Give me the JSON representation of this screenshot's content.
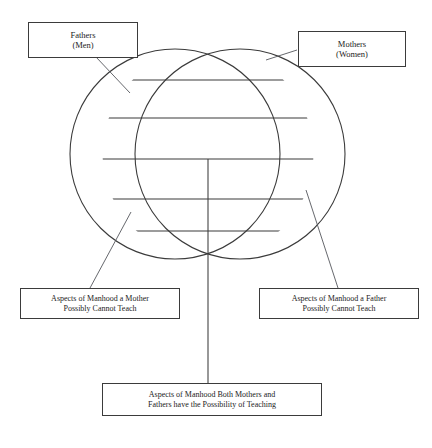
{
  "diagram": {
    "type": "venn-overlapping-circles",
    "background_color": "#ffffff",
    "stroke_color": "#3b3b3b",
    "boxes": [
      {
        "id": "fathers",
        "name": "fathers-men-box",
        "lines": [
          "Fathers",
          "(Men)"
        ],
        "position": "top-left"
      },
      {
        "id": "mothers",
        "name": "mothers-women-box",
        "lines": [
          "Mothers",
          "(Women)"
        ],
        "position": "top-right"
      },
      {
        "id": "mother_cannot",
        "name": "aspects-mother-cannot-teach-box",
        "lines": [
          "Aspects of Manhood a Mother",
          "Possibly Cannot Teach"
        ],
        "position": "bottom-left"
      },
      {
        "id": "father_cannot",
        "name": "aspects-father-cannot-teach-box",
        "lines": [
          "Aspects of Manhood a Father",
          "Possibly Cannot Teach"
        ],
        "position": "bottom-right"
      },
      {
        "id": "both",
        "name": "aspects-both-can-teach-box",
        "lines": [
          "Aspects of Manhood Both Mothers and",
          "Fathers have the Possibility of Teaching"
        ],
        "position": "bottom-center"
      }
    ],
    "circles": [
      {
        "id": "left-circle",
        "label": "Fathers (Men)",
        "cx": 175,
        "cy": 154,
        "r": 105
      },
      {
        "id": "right-circle",
        "label": "Mothers (Women)",
        "cx": 240,
        "cy": 154,
        "r": 105
      }
    ],
    "intersection_points": {
      "top": {
        "x": 208,
        "y": 48
      },
      "bottom": {
        "x": 208,
        "y": 259
      }
    },
    "horizontal_dividers_y": [
      80,
      118,
      159,
      199,
      231
    ],
    "vertical_divider": {
      "x": 208,
      "from_y": 159,
      "to_y": 383
    },
    "connectors": [
      {
        "name": "fathers-connector",
        "from": {
          "x": 96,
          "y": 57
        },
        "to": {
          "x": 130,
          "y": 93
        }
      },
      {
        "name": "mothers-connector",
        "from": {
          "x": 297,
          "y": 50
        },
        "to": {
          "x": 266,
          "y": 60
        }
      },
      {
        "name": "mother-cannot-connector",
        "from": {
          "x": 90,
          "y": 288
        },
        "to": {
          "x": 131,
          "y": 212
        }
      },
      {
        "name": "father-cannot-connector",
        "from": {
          "x": 338,
          "y": 288
        },
        "to": {
          "x": 306,
          "y": 190
        }
      },
      {
        "name": "both-connector",
        "from": {
          "x": 208,
          "y": 383
        },
        "to": {
          "x": 208,
          "y": 259
        }
      }
    ]
  }
}
